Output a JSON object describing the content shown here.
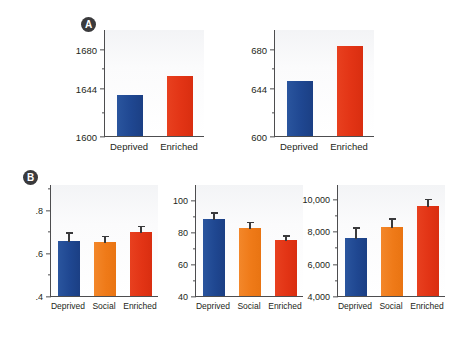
{
  "figure": {
    "background": "#ffffff",
    "colors": {
      "blue": "#1f4791",
      "orange": "#ef7a18",
      "red": "#e23415",
      "axis": "#4d4d4f",
      "text": "#231f20",
      "panel_badge": "#3a3a3c"
    }
  },
  "panels": [
    {
      "id": "A",
      "label": "A"
    },
    {
      "id": "B",
      "label": "B"
    }
  ],
  "chart_data": [
    {
      "id": "total-brain",
      "panel": "A",
      "type": "bar",
      "title": "Total brain",
      "subtitle": "(mg)",
      "units": "mg",
      "categories": [
        "Deprived",
        "Enriched"
      ],
      "values": [
        1638,
        1655
      ],
      "colors": [
        "#1f4791",
        "#e23415"
      ],
      "ylabel": "",
      "xlabel": "",
      "ylim": [
        1600,
        1698
      ],
      "yticks": [
        1600,
        1644,
        1680
      ],
      "yticklabels": [
        "1600",
        "1644",
        "1680"
      ],
      "minor_yticks": [
        1622,
        1662
      ],
      "errors": [
        0,
        0
      ],
      "grid": false,
      "legend": "none"
    },
    {
      "id": "cerebral-cortex",
      "panel": "A",
      "type": "bar",
      "title": "Cerebral cortex",
      "subtitle": "(mg)",
      "units": "mg",
      "categories": [
        "Deprived",
        "Enriched"
      ],
      "values": [
        650,
        682
      ],
      "colors": [
        "#1f4791",
        "#e23415"
      ],
      "ylabel": "",
      "xlabel": "",
      "ylim": [
        600,
        698
      ],
      "yticks": [
        600,
        644,
        680
      ],
      "yticklabels": [
        "600",
        "644",
        "680"
      ],
      "minor_yticks": [
        622,
        662
      ],
      "errors": [
        0,
        0
      ],
      "grid": false,
      "legend": "none"
    },
    {
      "id": "synapses",
      "panel": "B",
      "type": "bar",
      "title": "Synapses",
      "subtitle": "(per mm3)",
      "units": "per mm3",
      "categories": [
        "Deprived",
        "Social",
        "Enriched"
      ],
      "values": [
        0.655,
        0.65,
        0.695
      ],
      "errors": [
        0.045,
        0.035,
        0.035
      ],
      "colors": [
        "#1f4791",
        "#ef7a18",
        "#e23415"
      ],
      "ylabel": "",
      "xlabel": "",
      "ylim": [
        0.4,
        0.92
      ],
      "yticks": [
        0.4,
        0.6,
        0.8
      ],
      "yticklabels": [
        ".4",
        ".6",
        ".8"
      ],
      "minor_yticks": [
        0.5,
        0.7,
        0.9
      ],
      "grid": false,
      "legend": "none"
    },
    {
      "id": "neurons",
      "panel": "B",
      "type": "bar",
      "title": "Neurons",
      "subtitle": "(per cm3)",
      "units": "per cm3",
      "categories": [
        "Deprived",
        "Social",
        "Enriched"
      ],
      "values": [
        88,
        82.5,
        75
      ],
      "errors": [
        5,
        4.5,
        3.5
      ],
      "colors": [
        "#1f4791",
        "#ef7a18",
        "#e23415"
      ],
      "ylabel": "",
      "xlabel": "",
      "ylim": [
        40,
        110
      ],
      "yticks": [
        40,
        60,
        80,
        100
      ],
      "yticklabels": [
        "40",
        "60",
        "80",
        "100"
      ],
      "minor_yticks": [
        50,
        70,
        90
      ],
      "grid": false,
      "legend": "none"
    },
    {
      "id": "synapses-per-neurons",
      "panel": "B",
      "type": "bar",
      "title": "Synapses/neurons",
      "subtitle": "",
      "units": "",
      "categories": [
        "Deprived",
        "Social",
        "Enriched"
      ],
      "values": [
        7600,
        8250,
        9550
      ],
      "errors": [
        700,
        600,
        500
      ],
      "colors": [
        "#1f4791",
        "#ef7a18",
        "#e23415"
      ],
      "ylabel": "",
      "xlabel": "",
      "ylim": [
        4000,
        10900
      ],
      "yticks": [
        4000,
        6000,
        8000,
        10000
      ],
      "yticklabels": [
        "4,000",
        "6,000",
        "8,000",
        "10,000"
      ],
      "minor_yticks": [
        5000,
        7000,
        9000
      ],
      "grid": false,
      "legend": "none"
    }
  ]
}
